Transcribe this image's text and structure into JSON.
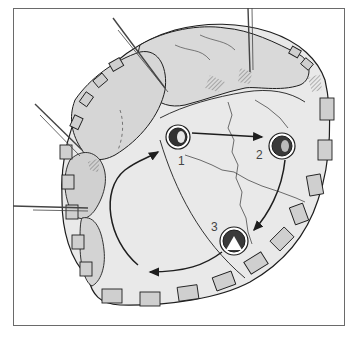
{
  "figure": {
    "colors": {
      "background": "#ffffff",
      "tissue_fill": "#e6e6e6",
      "tissue_shadow": "#d2d2d2",
      "pledget_fill": "#cfcfcf",
      "line": "#1e1e1e",
      "frame": "#6a6a6a"
    },
    "markers": [
      {
        "id": "1",
        "label": "1"
      },
      {
        "id": "2",
        "label": "2"
      },
      {
        "id": "3",
        "label": "3"
      }
    ],
    "arrows": [
      {
        "from": "1",
        "to": "2",
        "direction": "right"
      },
      {
        "from": "2",
        "to": "3",
        "direction": "down-curve"
      },
      {
        "from": "3",
        "to": "loop",
        "direction": "left-curve"
      },
      {
        "from": "loop",
        "to": "1",
        "direction": "up-curve"
      }
    ],
    "retractors": [
      {
        "name": "top-diagonal"
      },
      {
        "name": "top-vertical"
      },
      {
        "name": "left-diagonal"
      },
      {
        "name": "left-horizontal"
      }
    ]
  }
}
